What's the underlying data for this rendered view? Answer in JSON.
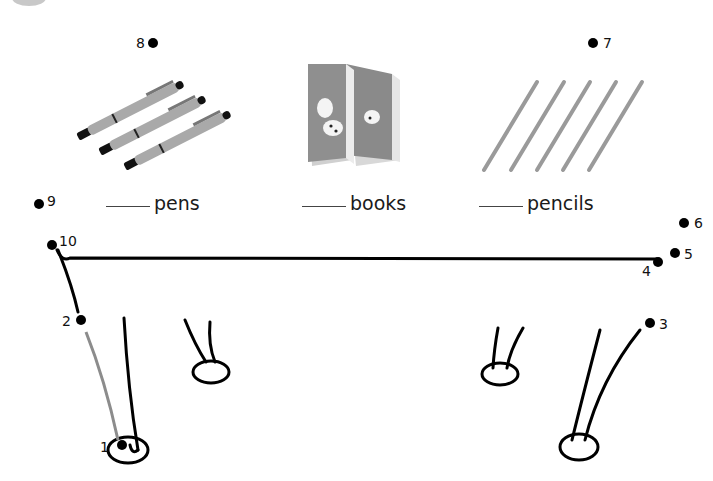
{
  "worksheet": {
    "captions": [
      {
        "blank": "",
        "word": "pens"
      },
      {
        "blank": "",
        "word": "books"
      },
      {
        "blank": "",
        "word": "pencils"
      }
    ],
    "items": [
      {
        "name": "pens",
        "count_shown": 3
      },
      {
        "name": "books",
        "count_shown": 2
      },
      {
        "name": "pencils",
        "count_shown": 5
      }
    ],
    "dots": [
      {
        "n": "1"
      },
      {
        "n": "2"
      },
      {
        "n": "3"
      },
      {
        "n": "4"
      },
      {
        "n": "5"
      },
      {
        "n": "6"
      },
      {
        "n": "7"
      },
      {
        "n": "8"
      },
      {
        "n": "9"
      },
      {
        "n": "10"
      }
    ],
    "colors": {
      "ink": "#000000",
      "item_gray": "#8a8a8a",
      "guide_gray": "#8c8c8c"
    }
  }
}
